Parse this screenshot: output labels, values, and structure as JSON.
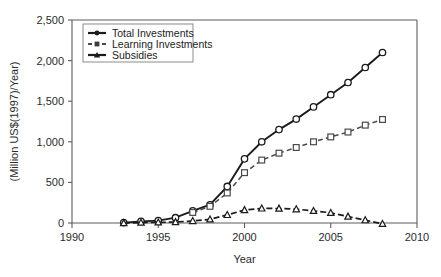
{
  "figure": {
    "cropped_title_fragment": "",
    "background": "#ffffff"
  },
  "chart_data": {
    "type": "line",
    "title": "",
    "xlabel": "Year",
    "ylabel": "(Million US$(1997)/Year)",
    "xlim": [
      1990,
      2010
    ],
    "ylim": [
      0,
      2500
    ],
    "xticks": [
      "1990",
      "1995",
      "2000",
      "2005",
      "2010"
    ],
    "xtick_values": [
      1990,
      1995,
      2000,
      2005,
      2010
    ],
    "yticks": [
      "0",
      "500",
      "1,000",
      "1,500",
      "2,000",
      "2,500"
    ],
    "ytick_values": [
      0,
      500,
      1000,
      1500,
      2000,
      2500
    ],
    "grid": false,
    "legend_position": "upper-left-inside",
    "x": [
      1993,
      1994,
      1995,
      1996,
      1997,
      1998,
      1999,
      2000,
      2001,
      2002,
      2003,
      2004,
      2005,
      2006,
      2007,
      2008
    ],
    "series": [
      {
        "name": "Total Investments",
        "marker": "open-circle",
        "line": "solid",
        "color": "#1b1b1b",
        "values": [
          5,
          20,
          30,
          65,
          150,
          225,
          450,
          790,
          1000,
          1150,
          1280,
          1430,
          1580,
          1730,
          1915,
          2100
        ]
      },
      {
        "name": "Learning Investments",
        "marker": "open-square",
        "line": "dashed",
        "color": "#4a4a4a",
        "values": [
          null,
          null,
          null,
          null,
          130,
          205,
          370,
          620,
          775,
          860,
          930,
          1000,
          1060,
          1120,
          1205,
          1275
        ]
      },
      {
        "name": "Subsidies",
        "marker": "open-triangle",
        "line": "dashed",
        "color": "#1b1b1b",
        "values": [
          0,
          5,
          8,
          12,
          25,
          45,
          100,
          160,
          180,
          178,
          170,
          150,
          125,
          80,
          35,
          -10
        ]
      }
    ]
  },
  "legend": {
    "entries": [
      {
        "label": "Total Investments",
        "marker": "filled-circle",
        "line": "solid"
      },
      {
        "label": "Learning Investments",
        "marker": "filled-square",
        "line": "dashed"
      },
      {
        "label": "Subsidies",
        "marker": "filled-triangle",
        "line": "solid"
      }
    ]
  }
}
